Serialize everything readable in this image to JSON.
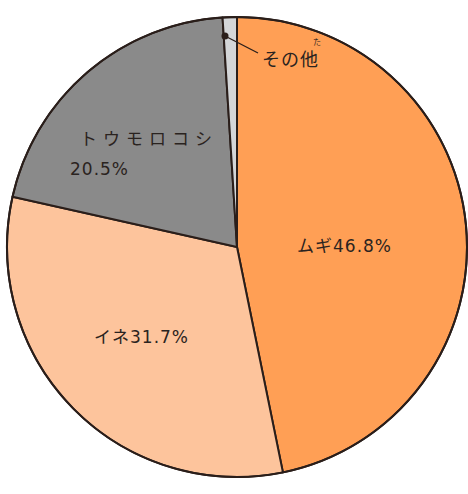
{
  "chart_data": {
    "type": "pie",
    "title": "",
    "categories": [
      "ムギ",
      "イネ",
      "トウモロコシ",
      "その他"
    ],
    "values": [
      46.8,
      31.7,
      20.5,
      1.0
    ],
    "unit": "%",
    "colors": [
      "#ff9f55",
      "#fdc49c",
      "#8a8a8a",
      "#d4d6d8"
    ],
    "start_angle_deg": 0,
    "direction": "clockwise",
    "labels": [
      {
        "name": "ムギ",
        "value": "46.8%",
        "text": "ムギ46.8%"
      },
      {
        "name": "イネ",
        "value": "31.7%",
        "text": "イネ31.7%"
      },
      {
        "name": "トウモロコシ",
        "value": "20.5%",
        "line1": "トウモロコシ",
        "line2": "20.5%"
      },
      {
        "name": "その他",
        "text": "その他",
        "ruby": "た",
        "leader_line": true
      }
    ]
  }
}
